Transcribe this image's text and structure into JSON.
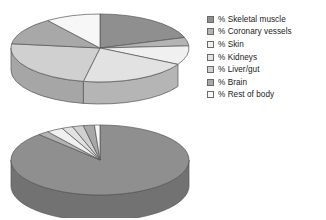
{
  "figure": {
    "background_color": "#ffffff",
    "chart_count": 2,
    "style": "3d-exploded-pie"
  },
  "legend": {
    "position": "right",
    "items": [
      {
        "label": "% Skeletal muscle",
        "color": "#8f8f8f"
      },
      {
        "label": "% Coronary vessels",
        "color": "#b4b4b4"
      },
      {
        "label": "% Skin",
        "color": "#f0f0f0"
      },
      {
        "label": "% Kidneys",
        "color": "#e2e2e2"
      },
      {
        "label": "% Liver/gut",
        "color": "#d0d0d0"
      },
      {
        "label": "% Brain",
        "color": "#a8a8a8"
      },
      {
        "label": "% Rest of body",
        "color": "#f7f7f7"
      }
    ]
  },
  "chart_data": [
    {
      "type": "pie",
      "id": "pie-resting",
      "title": "",
      "position": "top",
      "three_d": true,
      "legend_position": "right",
      "labels": [
        "% Skeletal muscle",
        "% Coronary vessels",
        "% Skin",
        "% Kidneys",
        "% Liver/gut",
        "% Brain",
        "% Rest of body"
      ],
      "values": [
        20,
        4,
        9,
        20,
        24,
        13,
        10
      ],
      "colors": [
        "#8f8f8f",
        "#b4b4b4",
        "#f0f0f0",
        "#e2e2e2",
        "#d0d0d0",
        "#a8a8a8",
        "#f7f7f7"
      ],
      "units": "percent",
      "total": 100
    },
    {
      "type": "pie",
      "id": "pie-exercise",
      "title": "",
      "position": "bottom",
      "three_d": true,
      "legend_position": "right",
      "labels": [
        "% Skeletal muscle",
        "% Coronary vessels",
        "% Skin",
        "% Kidneys",
        "% Liver/gut",
        "% Brain",
        "% Rest of body"
      ],
      "values": [
        88,
        2,
        3,
        2,
        2,
        2,
        1
      ],
      "colors": [
        "#8f8f8f",
        "#b4b4b4",
        "#f0f0f0",
        "#e2e2e2",
        "#d0d0d0",
        "#a8a8a8",
        "#f7f7f7"
      ],
      "units": "percent",
      "total": 100
    }
  ]
}
